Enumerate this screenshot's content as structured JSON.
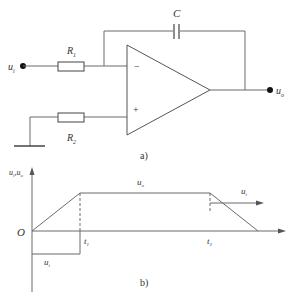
{
  "circuit": {
    "input_label": "u",
    "input_sub": "i",
    "output_label": "u",
    "output_sub": "o",
    "resistor1_label": "R",
    "resistor1_sub": "1",
    "resistor2_label": "R",
    "resistor2_sub": "2",
    "capacitor_label": "C",
    "inverting_sign": "−",
    "noninverting_sign": "+",
    "caption": "a)"
  },
  "waveform": {
    "y_axis_label": "u",
    "y_axis_sub1": "i",
    "y_axis_mid": ",u",
    "y_axis_sub2": "o",
    "origin_label": "O",
    "uo_label": "u",
    "uo_sub": "o",
    "ui_top_label": "u",
    "ui_top_sub": "i",
    "ui_bottom_label": "u",
    "ui_bottom_sub": "i",
    "t1_label": "t",
    "t1_sub": "1",
    "t2_label": "t",
    "t2_sub": "2",
    "caption": "b)"
  }
}
